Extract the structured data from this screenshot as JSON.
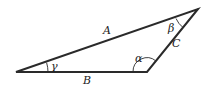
{
  "diagram": {
    "type": "triangle",
    "vertices": {
      "left": {
        "x": 16,
        "y": 72
      },
      "bottom_right": {
        "x": 147,
        "y": 72
      },
      "top": {
        "x": 198,
        "y": 9
      }
    },
    "sides": {
      "A": "A",
      "B": "B",
      "C": "C"
    },
    "angles": {
      "gamma": "γ",
      "alpha": "α",
      "beta": "β"
    },
    "colors": {
      "stroke": "#2a2a2a",
      "background": "#ffffff"
    }
  }
}
